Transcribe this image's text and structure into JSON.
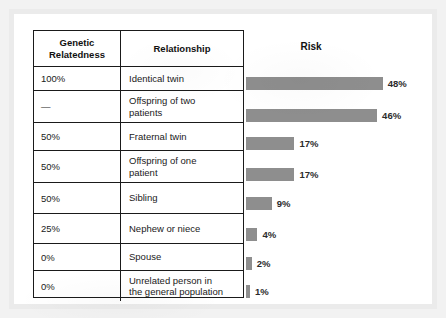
{
  "figure": {
    "table_headers": {
      "genetic_relatedness": "Genetic\nRelatedness",
      "genetic_relatedness_line1": "Genetic",
      "genetic_relatedness_line2": "Relatedness",
      "relationship": "Relationship"
    },
    "chart_title": "Risk",
    "bar_color": "#8e8e8e",
    "border_color": "#1a1a1a",
    "rows": [
      {
        "relatedness": "100%",
        "relationship": "Identical twin",
        "relationship_line1": "Identical twin",
        "relationship_line2": "",
        "risk_label": "48%",
        "risk_value": 48
      },
      {
        "relatedness": "—",
        "relationship": "Offspring of two patients",
        "relationship_line1": "Offspring of two",
        "relationship_line2": "patients",
        "risk_label": "46%",
        "risk_value": 46
      },
      {
        "relatedness": "50%",
        "relationship": "Fraternal twin",
        "relationship_line1": "Fraternal twin",
        "relationship_line2": "",
        "risk_label": "17%",
        "risk_value": 17
      },
      {
        "relatedness": "50%",
        "relationship": "Offspring of one patient",
        "relationship_line1": "Offspring of one",
        "relationship_line2": "patient",
        "risk_label": "17%",
        "risk_value": 17
      },
      {
        "relatedness": "50%",
        "relationship": "Sibling",
        "relationship_line1": "Sibling",
        "relationship_line2": "",
        "risk_label": "9%",
        "risk_value": 9
      },
      {
        "relatedness": "25%",
        "relationship": "Nephew or niece",
        "relationship_line1": "Nephew or niece",
        "relationship_line2": "",
        "risk_label": "4%",
        "risk_value": 4
      },
      {
        "relatedness": "0%",
        "relationship": "Spouse",
        "relationship_line1": "Spouse",
        "relationship_line2": "",
        "risk_label": "2%",
        "risk_value": 2
      },
      {
        "relatedness": "0%",
        "relationship": "Unrelated person in the general population",
        "relationship_line1": "Unrelated person in",
        "relationship_line2": "the general population",
        "risk_label": "1%",
        "risk_value": 1
      }
    ]
  },
  "chart_data": {
    "type": "bar",
    "title": "Risk",
    "xlabel": "",
    "ylabel": "",
    "orientation": "horizontal",
    "grid": false,
    "legend": null,
    "xlim": [
      0,
      48
    ],
    "categories": [
      "Identical twin",
      "Offspring of two patients",
      "Fraternal twin",
      "Offspring of one patient",
      "Sibling",
      "Nephew or niece",
      "Spouse",
      "Unrelated person in the general population"
    ],
    "values": [
      48,
      46,
      17,
      17,
      9,
      4,
      2,
      1
    ],
    "value_labels": [
      "48%",
      "46%",
      "17%",
      "17%",
      "9%",
      "4%",
      "2%",
      "1%"
    ],
    "genetic_relatedness": [
      "100%",
      "—",
      "50%",
      "50%",
      "50%",
      "25%",
      "0%",
      "0%"
    ],
    "units": "percent"
  }
}
